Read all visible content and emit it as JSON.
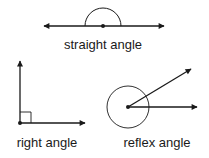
{
  "diagram": {
    "straight": {
      "label": "straight angle"
    },
    "right": {
      "label": "right angle"
    },
    "reflex": {
      "label": "reflex angle"
    }
  },
  "colors": {
    "stroke": "#1a1a1a",
    "background": "#ffffff"
  }
}
